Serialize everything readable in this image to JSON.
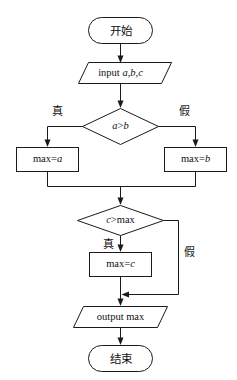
{
  "diagram": {
    "type": "flowchart",
    "orientation": "top-to-bottom",
    "background_color": "#ffffff",
    "line_color": "#1a1a1a",
    "text_color": "#111111"
  },
  "nodes": {
    "start": {
      "shape": "terminator",
      "label": "开始"
    },
    "input": {
      "shape": "parallelogram",
      "label": "input a,b,c",
      "label_keyword": "input",
      "label_vars": "a,b,c"
    },
    "decision_ab": {
      "shape": "diamond",
      "label": "a>b",
      "label_left_var": "a",
      "label_op": ">",
      "label_right_var": "b"
    },
    "assign_max_a": {
      "shape": "process",
      "label": "max=a",
      "label_keyword": "max=",
      "label_vars": "a"
    },
    "assign_max_b": {
      "shape": "process",
      "label": "max=b",
      "label_keyword": "max=",
      "label_vars": "b"
    },
    "decision_cmax": {
      "shape": "diamond",
      "label": "c>max",
      "label_left_var": "c",
      "label_op": ">",
      "label_right_var": "max"
    },
    "assign_max_c": {
      "shape": "process",
      "label": "max=c",
      "label_keyword": "max=",
      "label_vars": "c"
    },
    "output": {
      "shape": "parallelogram",
      "label": "output max"
    },
    "end": {
      "shape": "terminator",
      "label": "结束"
    }
  },
  "edge_labels": {
    "ab_true": "真",
    "ab_false": "假",
    "cmax_true": "真",
    "cmax_false": "假"
  },
  "flow_sequence": [
    "开始",
    "input a,b,c",
    "a>b",
    "max=a",
    "max=b",
    "c>max",
    "max=c",
    "output max",
    "结束"
  ]
}
